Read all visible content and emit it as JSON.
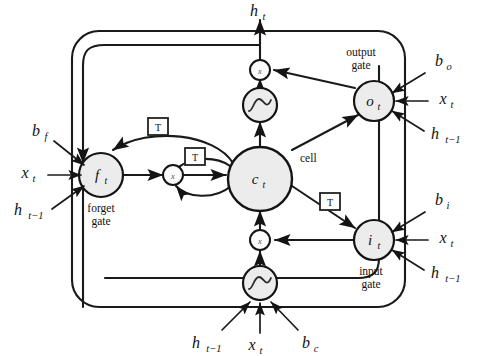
{
  "figure": {
    "kind": "lstm-cell-block-diagram",
    "background_color": "#ffffff",
    "line_color": "#1a1a1a",
    "node_fill_color": "#ececec",
    "small_node_fill_color": "#fbfbfb"
  },
  "outer_block": {
    "name": "lstm-memory-block",
    "corner_radius": 26
  },
  "nodes": {
    "output_signal": {
      "label": "h",
      "sub": "t"
    },
    "output_gate": {
      "label": "o",
      "sub": "t",
      "caption_line1": "output",
      "caption_line2": "gate"
    },
    "forget_gate": {
      "label": "f",
      "sub": "t",
      "caption_line1": "forget",
      "caption_line2": "gate"
    },
    "input_gate": {
      "label": "i",
      "sub": "t",
      "caption_line1": "input",
      "caption_line2": "gate"
    },
    "cell": {
      "label": "c",
      "sub": "t",
      "caption": "cell"
    },
    "multiply_symbol": "x",
    "delay_symbol": "T"
  },
  "inputs": {
    "forget_gate": [
      {
        "label": "b",
        "sub": "f"
      },
      {
        "label": "x",
        "sub": "t"
      },
      {
        "label": "h",
        "sub": "t−1"
      }
    ],
    "output_gate": [
      {
        "label": "b",
        "sub": "o"
      },
      {
        "label": "x",
        "sub": "t"
      },
      {
        "label": "h",
        "sub": "t−1"
      }
    ],
    "input_gate": [
      {
        "label": "b",
        "sub": "i"
      },
      {
        "label": "x",
        "sub": "t"
      },
      {
        "label": "h",
        "sub": "t−1"
      }
    ],
    "cell_input": [
      {
        "label": "h",
        "sub": "t−1"
      },
      {
        "label": "x",
        "sub": "t"
      },
      {
        "label": "b",
        "sub": "c"
      }
    ]
  },
  "delay_boxes": [
    {
      "name": "delay-forget-recurrent",
      "symbol": "T"
    },
    {
      "name": "delay-cell-state-feedback",
      "symbol": "T"
    },
    {
      "name": "delay-input-gate-peephole",
      "symbol": "T"
    }
  ],
  "multipliers": [
    {
      "name": "multiply-output",
      "symbol": "x"
    },
    {
      "name": "multiply-forget",
      "symbol": "x"
    },
    {
      "name": "multiply-input",
      "symbol": "x"
    }
  ],
  "activations": [
    {
      "name": "activation-output-tanh",
      "shape": "sigmoid-curve"
    },
    {
      "name": "activation-cell-input-tanh",
      "shape": "sigmoid-curve"
    }
  ]
}
